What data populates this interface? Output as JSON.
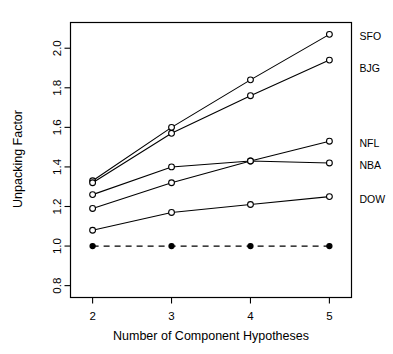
{
  "chart_data": {
    "type": "line",
    "title": "",
    "xlabel": "Number of Component Hypotheses",
    "ylabel": "Unpacking Factor",
    "x": [
      2,
      3,
      4,
      5
    ],
    "xticklabels": [
      "2",
      "3",
      "4",
      "5"
    ],
    "yticks": [
      0.8,
      1.0,
      1.2,
      1.4,
      1.6,
      1.8,
      2.0
    ],
    "yticklabels": [
      "0.8",
      "1.0",
      "1.2",
      "1.4",
      "1.6",
      "1.8",
      "2.0"
    ],
    "xlim": [
      1.72,
      5.28
    ],
    "ylim": [
      0.74,
      2.13
    ],
    "grid": false,
    "legend_position": "right-of-axes-inline",
    "series": [
      {
        "name": "SFO",
        "label": "SFO",
        "marker": "open-circle",
        "linestyle": "solid",
        "values": [
          1.33,
          1.6,
          1.84,
          2.07
        ],
        "label_y": 2.06
      },
      {
        "name": "BJG",
        "label": "BJG",
        "marker": "open-circle",
        "linestyle": "solid",
        "values": [
          1.32,
          1.57,
          1.76,
          1.94
        ],
        "label_y": 1.9
      },
      {
        "name": "NFL",
        "label": "NFL",
        "marker": "open-circle",
        "linestyle": "solid",
        "values": [
          1.19,
          1.32,
          1.43,
          1.53
        ],
        "label_y": 1.52
      },
      {
        "name": "NBA",
        "label": "NBA",
        "marker": "open-circle",
        "linestyle": "solid",
        "values": [
          1.26,
          1.4,
          1.43,
          1.42
        ],
        "label_y": 1.41
      },
      {
        "name": "DOW",
        "label": "DOW",
        "marker": "open-circle",
        "linestyle": "solid",
        "values": [
          1.08,
          1.17,
          1.21,
          1.25
        ],
        "label_y": 1.24
      },
      {
        "name": "baseline",
        "label": "",
        "marker": "filled-circle",
        "linestyle": "dashed",
        "values": [
          1.0,
          1.0,
          1.0,
          1.0
        ],
        "label_y": null
      }
    ]
  }
}
